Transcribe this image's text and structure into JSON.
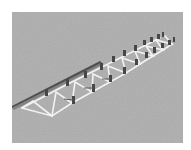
{
  "scene": {
    "description": "3D render of a flat truss structure with posts on gray textured ground",
    "background_color": "#ffffff",
    "ground_color": "#a9a9a9",
    "truss_color": "#f4f4f4",
    "rail_color": "#555555",
    "post_color": "#4a4a4a",
    "ground_rect": {
      "x": 12,
      "y": 12,
      "width": 171,
      "height": 131
    }
  }
}
